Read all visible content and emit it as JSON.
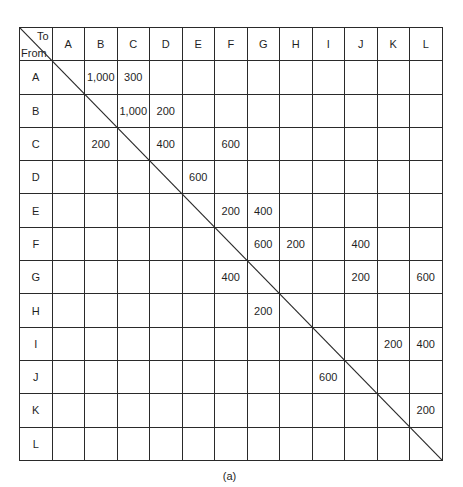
{
  "table": {
    "corner": {
      "to_label": "To",
      "from_label": "From"
    },
    "columns": [
      "A",
      "B",
      "C",
      "D",
      "E",
      "F",
      "G",
      "H",
      "I",
      "J",
      "K",
      "L"
    ],
    "rows": [
      {
        "label": "A",
        "cells": [
          "",
          "1,000",
          "300",
          "",
          "",
          "",
          "",
          "",
          "",
          "",
          "",
          ""
        ]
      },
      {
        "label": "B",
        "cells": [
          "",
          "",
          "1,000",
          "200",
          "",
          "",
          "",
          "",
          "",
          "",
          "",
          ""
        ]
      },
      {
        "label": "C",
        "cells": [
          "",
          "200",
          "",
          "400",
          "",
          "600",
          "",
          "",
          "",
          "",
          "",
          ""
        ]
      },
      {
        "label": "D",
        "cells": [
          "",
          "",
          "",
          "",
          "600",
          "",
          "",
          "",
          "",
          "",
          "",
          ""
        ]
      },
      {
        "label": "E",
        "cells": [
          "",
          "",
          "",
          "",
          "",
          "200",
          "400",
          "",
          "",
          "",
          "",
          ""
        ]
      },
      {
        "label": "F",
        "cells": [
          "",
          "",
          "",
          "",
          "",
          "",
          "600",
          "200",
          "",
          "400",
          "",
          ""
        ]
      },
      {
        "label": "G",
        "cells": [
          "",
          "",
          "",
          "",
          "",
          "400",
          "",
          "",
          "",
          "200",
          "",
          "600"
        ]
      },
      {
        "label": "H",
        "cells": [
          "",
          "",
          "",
          "",
          "",
          "",
          "200",
          "",
          "",
          "",
          "",
          ""
        ]
      },
      {
        "label": "I",
        "cells": [
          "",
          "",
          "",
          "",
          "",
          "",
          "",
          "",
          "",
          "",
          "200",
          "400"
        ]
      },
      {
        "label": "J",
        "cells": [
          "",
          "",
          "",
          "",
          "",
          "",
          "",
          "",
          "600",
          "",
          "",
          ""
        ]
      },
      {
        "label": "K",
        "cells": [
          "",
          "",
          "",
          "",
          "",
          "",
          "",
          "",
          "",
          "",
          "",
          "200"
        ]
      },
      {
        "label": "L",
        "cells": [
          "",
          "",
          "",
          "",
          "",
          "",
          "",
          "",
          "",
          "",
          "",
          ""
        ]
      }
    ]
  },
  "caption": "(a)",
  "colors": {
    "line": "#2a2a2a",
    "text": "#1f1f1f",
    "background": "#ffffff"
  }
}
